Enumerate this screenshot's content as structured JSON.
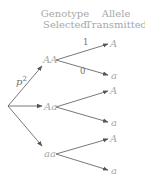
{
  "header": {
    "genotype_line1": "Genotype",
    "genotype_line2": "Selected",
    "allele_line1": "Allele",
    "allele_line2": "Transmitted"
  },
  "root": {
    "branch_label": "p",
    "branch_label_exp": "2"
  },
  "genotypes": [
    {
      "label": "AA",
      "branches": [
        {
          "allele": "A",
          "probability": "1"
        },
        {
          "allele": "a",
          "probability": "0"
        }
      ]
    },
    {
      "label": "Aa",
      "branches": [
        {
          "allele": "A",
          "probability": ""
        },
        {
          "allele": "a",
          "probability": ""
        }
      ]
    },
    {
      "label": "aa",
      "branches": [
        {
          "allele": "A",
          "probability": ""
        },
        {
          "allele": "a",
          "probability": ""
        }
      ]
    }
  ],
  "colors": {
    "line": "#555555",
    "text_light": "#a8a8a8",
    "text_dark": "#707070"
  }
}
